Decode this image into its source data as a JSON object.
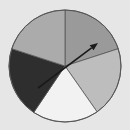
{
  "background": "#e6e6e6",
  "spinner": {
    "center": [
      65,
      66
    ],
    "radius": 56,
    "outline_color": "#555555",
    "sectors": [
      {
        "name": "sector-top-right",
        "start_deg": 18,
        "end_deg": 90,
        "color": "#9a9a9a"
      },
      {
        "name": "sector-right",
        "start_deg": -55,
        "end_deg": 18,
        "color": "#bdbdbd"
      },
      {
        "name": "sector-bottom",
        "start_deg": -124,
        "end_deg": -55,
        "color": "#f2f2f2"
      },
      {
        "name": "sector-left-dark",
        "start_deg": 162,
        "end_deg": 236,
        "color": "#2e2e2e"
      },
      {
        "name": "sector-top-left",
        "start_deg": 90,
        "end_deg": 162,
        "color": "#ababab"
      }
    ],
    "arrow": {
      "from": [
        38,
        88
      ],
      "to": [
        98,
        43
      ],
      "color": "#1a1a1a"
    }
  }
}
